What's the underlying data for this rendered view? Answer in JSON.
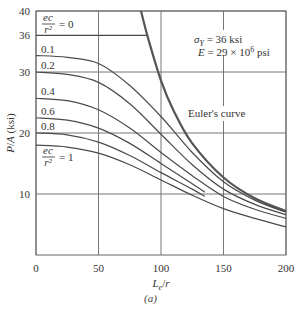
{
  "chart_data": {
    "type": "line",
    "title": "",
    "xlabel": "Le/r",
    "ylabel": "P/A (ksi)",
    "xlim": [
      0,
      200
    ],
    "ylim": [
      0,
      40
    ],
    "grid": true,
    "x_ticks": [
      0,
      50,
      100,
      150,
      200
    ],
    "y_ticks": [
      10,
      20,
      30,
      36,
      40
    ],
    "annotations": {
      "material_line1": "σY = 36 ksi",
      "material_line2": "E = 29 × 10⁶ psi",
      "euler_label": "Euler's curve",
      "ec_label_top": "ec/r² = 0",
      "ec_label_bottom": "ec/r² = 1"
    },
    "series": [
      {
        "name": "ec/r² = 0",
        "label": "",
        "x": [
          0,
          89
        ],
        "values": [
          36,
          36
        ]
      },
      {
        "name": "Euler's curve",
        "x": [
          84,
          90,
          100,
          110,
          125,
          150,
          175,
          200
        ],
        "values": [
          40,
          35.3,
          28.6,
          23.7,
          18.3,
          12.7,
          9.3,
          7.2
        ]
      },
      {
        "name": "ec/r² = 0.1",
        "label": "0.1",
        "x": [
          0,
          25,
          50,
          75,
          100,
          125,
          150,
          175,
          200
        ],
        "values": [
          32.7,
          32.4,
          31.4,
          27.8,
          22.7,
          16.8,
          12.0,
          9.0,
          7.0
        ]
      },
      {
        "name": "ec/r² = 0.2",
        "label": "0.2",
        "x": [
          0,
          25,
          50,
          75,
          100,
          125,
          150,
          175,
          200
        ],
        "values": [
          30.0,
          29.6,
          28.3,
          24.8,
          19.8,
          14.8,
          10.8,
          8.3,
          6.6
        ]
      },
      {
        "name": "ec/r² = 0.4",
        "label": "0.4",
        "x": [
          0,
          25,
          50,
          75,
          100,
          125,
          150,
          175,
          200
        ],
        "values": [
          25.7,
          25.3,
          23.8,
          20.8,
          16.8,
          13.0,
          9.6,
          7.5,
          6.0
        ]
      },
      {
        "name": "ec/r² = 0.6",
        "label": "0.6",
        "x": [
          0,
          25,
          50,
          75,
          100,
          125,
          135
        ],
        "values": [
          22.5,
          22.1,
          20.8,
          18.3,
          15.0,
          11.7,
          10.3
        ]
      },
      {
        "name": "ec/r² = 0.8",
        "label": "0.8",
        "x": [
          0,
          25,
          50,
          75,
          100,
          125,
          135
        ],
        "values": [
          20.0,
          19.7,
          18.5,
          16.3,
          13.5,
          10.8,
          9.6
        ]
      },
      {
        "name": "ec/r² = 1",
        "label": "",
        "x": [
          0,
          25,
          50,
          75,
          100,
          125,
          150,
          175,
          200
        ],
        "values": [
          18.0,
          17.7,
          16.7,
          14.8,
          12.3,
          9.8,
          7.6,
          6.0,
          4.6
        ]
      }
    ]
  },
  "figure": {
    "panel_label": "(a)",
    "caption_fragment": "Fig. ..."
  }
}
